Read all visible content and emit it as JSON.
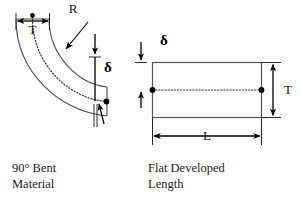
{
  "figure": {
    "background_color": "#ffffff",
    "line_color": "#4a4a4a",
    "dimension_color": "#000000"
  },
  "left_view": {
    "caption_line1": "90° Bent",
    "caption_line2": "Material",
    "labels": {
      "radius": "R",
      "thickness": "T",
      "delta": "δ"
    }
  },
  "right_view": {
    "caption_line1": "Flat Developed",
    "caption_line2": "Length",
    "labels": {
      "thickness": "T",
      "length": "L",
      "delta": "δ"
    }
  }
}
